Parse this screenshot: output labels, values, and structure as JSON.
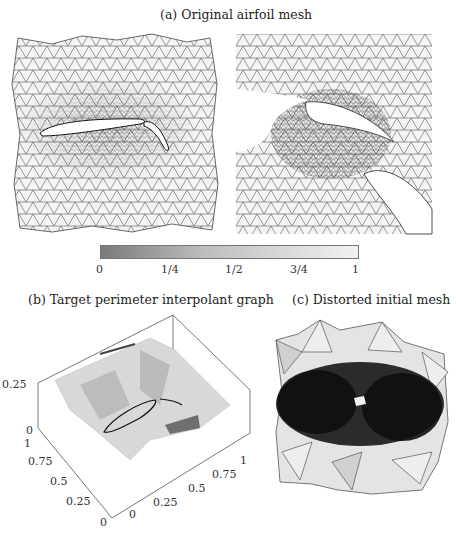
{
  "figure": {
    "panel_a": {
      "caption": "(a) Original airfoil mesh",
      "left_view": "full domain mesh around multi-element airfoil (main wing + flap)",
      "right_view": "zoomed view of slot between main element and flap"
    },
    "colorbar": {
      "ticks": [
        "0",
        "1/4",
        "1/2",
        "3/4",
        "1"
      ],
      "gradient_start": "#808080",
      "gradient_end": "#f8f8f8"
    },
    "panel_b": {
      "caption": "(b) Target perimeter interpolant graph",
      "z_ticks": [
        "0",
        "0.25"
      ],
      "y_ticks": [
        "0",
        "0.25",
        "0.5",
        "0.75",
        "1"
      ],
      "x_ticks": [
        "0",
        "0.25",
        "0.5",
        "0.75",
        "1"
      ]
    },
    "panel_c": {
      "caption": "(c) Distorted initial mesh"
    }
  }
}
